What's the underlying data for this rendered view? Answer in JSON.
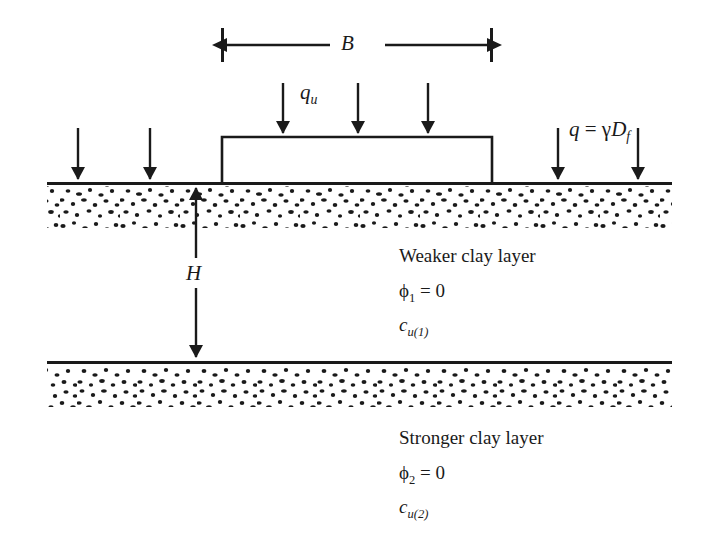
{
  "figure": {
    "type": "geotechnical-cross-section",
    "ink_color": "#1a1a1a",
    "background_color": "#ffffff"
  },
  "labels": {
    "width_B": "B",
    "ultimate_load": "q",
    "ultimate_load_sub": "u",
    "surcharge_lhs": "q",
    "surcharge_eq": " = ",
    "surcharge_gamma": "γ",
    "surcharge_D": "D",
    "surcharge_D_sub": "f",
    "depth_H": "H",
    "weaker_layer": "Weaker clay layer",
    "phi1": "ϕ",
    "phi1_sub": "1",
    "phi1_eq": " = 0",
    "cu1": "c",
    "cu1_sub": "u(1)",
    "stronger_layer": "Stronger clay layer",
    "phi2": "ϕ",
    "phi2_sub": "2",
    "phi2_eq": " = 0",
    "cu2": "c",
    "cu2_sub": "u(2)"
  },
  "geometry": {
    "ground_line_y": 183,
    "ground_line_x1": 47,
    "ground_line_x2": 672,
    "layer_boundary_y": 362,
    "stipple_band_height": 43,
    "foundation_left_x": 222,
    "foundation_right_x": 492,
    "foundation_top_y": 137,
    "dimension_B_y": 45,
    "qu_arrow_x": [
      283,
      358,
      428
    ],
    "qu_arrow_top_y": 83,
    "surcharge_left_arrow_x": [
      78,
      150
    ],
    "surcharge_right_arrow_x": [
      558,
      638
    ],
    "surcharge_arrow_top_y": 128,
    "H_arrow_x": 196
  }
}
